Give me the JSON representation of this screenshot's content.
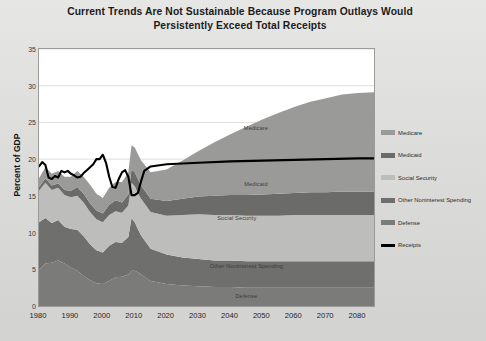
{
  "chart_data": {
    "type": "area",
    "title": "Current Trends Are Not Sustainable Because Program Outlays Would Persistently Exceed Total Receipts",
    "title_lines": [
      "Current Trends Are Not Sustainable Because Program Outlays Would",
      "Persistently Exceed Total Receipts"
    ],
    "xlabel": "",
    "ylabel": "Percent of GDP",
    "xlim": [
      1980,
      2085
    ],
    "ylim": [
      0,
      35
    ],
    "ytick_labels": [
      "0",
      "5",
      "10",
      "15",
      "20",
      "25",
      "30",
      "35"
    ],
    "ytick_values": [
      0,
      5,
      10,
      15,
      20,
      25,
      30,
      35
    ],
    "xtick_labels": [
      "1980",
      "1990",
      "2000",
      "2010",
      "2020",
      "2030",
      "2040",
      "2050",
      "2060",
      "2070",
      "2080"
    ],
    "xtick_values": [
      1980,
      1990,
      2000,
      2010,
      2020,
      2030,
      2040,
      2050,
      2060,
      2070,
      2080
    ],
    "grid": "horizontal",
    "stacked": true,
    "legend_position": "right",
    "x": [
      1980,
      1982,
      1984,
      1986,
      1988,
      1990,
      1992,
      1994,
      1996,
      1998,
      2000,
      2002,
      2004,
      2006,
      2008,
      2009,
      2010,
      2011,
      2012,
      2015,
      2020,
      2025,
      2030,
      2035,
      2040,
      2045,
      2050,
      2055,
      2060,
      2065,
      2070,
      2075,
      2080,
      2085
    ],
    "series": [
      {
        "name": "Defense",
        "color": "#7b7b79",
        "values": [
          4.9,
          5.8,
          5.9,
          6.2,
          5.8,
          5.2,
          4.8,
          4.1,
          3.5,
          3.1,
          3.0,
          3.4,
          3.9,
          4.0,
          4.3,
          4.8,
          4.8,
          4.6,
          4.3,
          3.4,
          3.0,
          2.8,
          2.7,
          2.6,
          2.6,
          2.5,
          2.5,
          2.5,
          2.5,
          2.5,
          2.5,
          2.5,
          2.5,
          2.5
        ]
      },
      {
        "name": "Other Noninterest Spending",
        "color": "#6f6f6d",
        "values": [
          6.5,
          6.2,
          5.4,
          5.5,
          5.0,
          5.3,
          5.6,
          5.4,
          4.9,
          4.5,
          4.3,
          4.8,
          4.8,
          4.6,
          5.1,
          7.2,
          6.6,
          5.9,
          5.3,
          4.4,
          4.0,
          3.8,
          3.7,
          3.6,
          3.6,
          3.6,
          3.6,
          3.6,
          3.6,
          3.6,
          3.6,
          3.6,
          3.6,
          3.6
        ]
      },
      {
        "name": "Social Security",
        "color": "#bdbdbb",
        "values": [
          4.3,
          4.8,
          4.5,
          4.4,
          4.3,
          4.3,
          4.6,
          4.6,
          4.4,
          4.2,
          4.1,
          4.2,
          4.2,
          4.1,
          4.3,
          4.8,
          4.9,
          4.9,
          5.0,
          5.0,
          5.3,
          5.8,
          6.1,
          6.2,
          6.2,
          6.2,
          6.2,
          6.2,
          6.3,
          6.3,
          6.3,
          6.3,
          6.3,
          6.3
        ]
      },
      {
        "name": "Medicaid",
        "color": "#6b6b69",
        "values": [
          0.5,
          0.6,
          0.6,
          0.6,
          0.7,
          0.9,
          1.2,
          1.2,
          1.2,
          1.2,
          1.2,
          1.4,
          1.5,
          1.4,
          1.5,
          1.8,
          1.9,
          1.9,
          1.8,
          1.8,
          2.0,
          2.2,
          2.4,
          2.6,
          2.7,
          2.8,
          2.9,
          3.0,
          3.0,
          3.1,
          3.1,
          3.2,
          3.2,
          3.2
        ]
      },
      {
        "name": "Medicare",
        "color": "#9a9a98",
        "values": [
          1.2,
          1.5,
          1.6,
          1.7,
          1.8,
          1.9,
          2.2,
          2.3,
          2.5,
          2.3,
          2.1,
          2.3,
          2.5,
          2.8,
          3.0,
          3.3,
          3.4,
          3.4,
          3.4,
          3.6,
          4.3,
          5.2,
          6.2,
          7.3,
          8.3,
          9.3,
          10.2,
          11.0,
          11.7,
          12.3,
          12.8,
          13.2,
          13.4,
          13.5
        ]
      }
    ],
    "line_series": {
      "name": "Receipts",
      "color": "#000000",
      "x": [
        1980,
        1981,
        1982,
        1983,
        1984,
        1985,
        1986,
        1987,
        1988,
        1989,
        1990,
        1991,
        1992,
        1993,
        1994,
        1995,
        1996,
        1997,
        1998,
        1999,
        2000,
        2001,
        2002,
        2003,
        2004,
        2005,
        2006,
        2007,
        2008,
        2009,
        2010,
        2011,
        2012,
        2013,
        2015,
        2020,
        2030,
        2040,
        2050,
        2060,
        2070,
        2080,
        2085
      ],
      "values": [
        19.0,
        19.6,
        19.2,
        17.5,
        17.3,
        17.7,
        17.5,
        18.4,
        18.2,
        18.4,
        18.0,
        17.8,
        17.5,
        17.6,
        18.1,
        18.5,
        18.9,
        19.3,
        20.0,
        20.0,
        20.6,
        19.5,
        17.6,
        16.2,
        16.1,
        17.3,
        18.2,
        18.5,
        17.6,
        15.1,
        15.1,
        15.4,
        17.0,
        18.4,
        19.0,
        19.3,
        19.5,
        19.7,
        19.8,
        19.9,
        20.0,
        20.1,
        20.1
      ]
    },
    "area_labels": [
      {
        "text": "Medicare",
        "x": 2048,
        "y": 24.2
      },
      {
        "text": "Medicaid",
        "x": 2048,
        "y": 16.6
      },
      {
        "text": "Social Security",
        "x": 2042,
        "y": 12.0
      },
      {
        "text": "Other Noninterest Spending",
        "x": 2045,
        "y": 5.5
      },
      {
        "text": "Defense",
        "x": 2045,
        "y": 1.4
      }
    ],
    "legend": [
      {
        "label": "Medicare",
        "color": "#9a9a98",
        "type": "swatch"
      },
      {
        "label": "Medicaid",
        "color": "#6b6b69",
        "type": "swatch"
      },
      {
        "label": "Social Security",
        "color": "#bdbdbb",
        "type": "swatch"
      },
      {
        "label": "Other Noninterest Spending",
        "color": "#6f6f6d",
        "type": "swatch"
      },
      {
        "label": "Defense",
        "color": "#7b7b79",
        "type": "swatch"
      },
      {
        "label": "Receipts",
        "color": "#000000",
        "type": "line"
      }
    ]
  }
}
